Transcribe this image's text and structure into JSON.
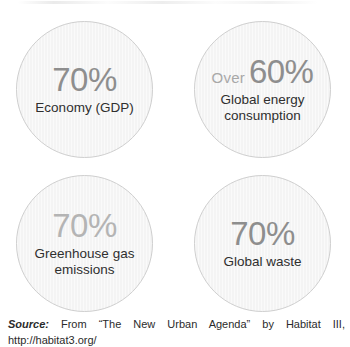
{
  "chart_data": {
    "type": "pie",
    "categories": [
      "Economy (GDP)",
      "Global energy consumption",
      "Greenhouse gas emissions",
      "Global waste"
    ],
    "values": [
      70,
      60,
      70,
      70
    ],
    "value_prefixes": [
      "",
      "Over",
      "",
      ""
    ],
    "value_display": [
      "70%",
      "60%",
      "70%",
      "70%"
    ],
    "xlabel": "",
    "ylabel": "",
    "legend": "none",
    "grid": false,
    "annotations": [
      "Source: From \"The New Urban Agenda\" by Habitat III, http://habitat3.org/"
    ]
  },
  "circles": [
    {
      "id": "economy",
      "prefix": "",
      "value": "70%",
      "label": "Economy (GDP)",
      "value_color": "#8e8e8e"
    },
    {
      "id": "energy",
      "prefix": "Over",
      "value": "60%",
      "label": "Global energy consumption",
      "value_color": "#8e8e8e"
    },
    {
      "id": "ghg",
      "prefix": "",
      "value": "70%",
      "label": "Greenhouse gas emissions",
      "value_color": "#b4b4b4"
    },
    {
      "id": "waste",
      "prefix": "",
      "value": "70%",
      "label": "Global waste",
      "value_color": "#8e8e8e"
    }
  ],
  "source": {
    "label": "Source:",
    "line1": "From “The New Urban Agenda” by Habitat III,",
    "line2": "http://habitat3.org/"
  },
  "colors": {
    "circle_fill": "#f4f4f4",
    "circle_border": "#cfcfcf",
    "value_strong": "#8e8e8e",
    "value_weak": "#b4b4b4",
    "label_text": "#2f2f2f",
    "source_text": "#2b2b2b",
    "background": "#ffffff"
  }
}
